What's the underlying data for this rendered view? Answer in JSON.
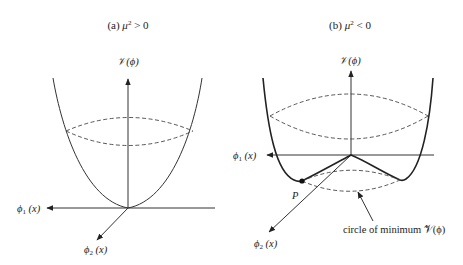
{
  "panels": [
    {
      "id": "a",
      "title_prefix": "(a) ",
      "title_symbol": "μ",
      "title_exp": "2",
      "title_relation": " > 0",
      "vertical_axis_label": "𝒱(ϕ)",
      "axis1_label": "ϕ",
      "axis1_sub": "1",
      "axis1_arg": " (x)",
      "axis2_label": "ϕ",
      "axis2_sub": "2",
      "axis2_arg": " (x)",
      "shape": "paraboloid with single minimum at origin"
    },
    {
      "id": "b",
      "title_prefix": "(b) ",
      "title_symbol": "μ",
      "title_exp": "2",
      "title_relation": " < 0",
      "vertical_axis_label": "𝒱(ϕ)",
      "axis1_label": "ϕ",
      "axis1_sub": "1",
      "axis1_arg": " (x)",
      "axis2_label": "ϕ",
      "axis2_sub": "2",
      "axis2_arg": " (x)",
      "point_label": "P",
      "annotation": "circle of minimum 𝒱(ϕ)",
      "shape": "mexican-hat potential with circle of minima"
    }
  ],
  "colors": {
    "background": "#ffffff",
    "stroke": "#333333",
    "text": "#222222"
  }
}
